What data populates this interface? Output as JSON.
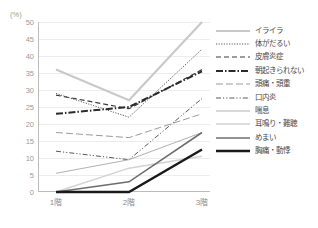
{
  "axis": {
    "unit_label": "(%)",
    "y_ticks": [
      0,
      5,
      10,
      15,
      20,
      25,
      30,
      35,
      40,
      45,
      50
    ],
    "x_ticks": [
      "1階",
      "2階",
      "3階"
    ]
  },
  "chart_data": {
    "type": "line",
    "title": "",
    "xlabel": "",
    "ylabel": "(%)",
    "ylim": [
      0,
      50
    ],
    "grid": true,
    "legend_position": "right",
    "categories": [
      "1階",
      "2階",
      "3階"
    ],
    "series": [
      {
        "name": "イライラ",
        "values": [
          36,
          27,
          50
        ],
        "color": "#c9c9c9",
        "width": 2.2,
        "dash": "none"
      },
      {
        "name": "体がだるい",
        "values": [
          29,
          22,
          42
        ],
        "color": "#5a5a5a",
        "width": 1.0,
        "dash": "1.2,1.4"
      },
      {
        "name": "皮膚炎症",
        "values": [
          28.5,
          24.5,
          36
        ],
        "color": "#3c3c3c",
        "width": 1.2,
        "dash": "5,3"
      },
      {
        "name": "朝起きられない",
        "values": [
          23,
          25,
          35.5
        ],
        "color": "#2b2b2b",
        "width": 2.0,
        "dash": "7,2,1.5,2"
      },
      {
        "name": "頭痛・頭重",
        "values": [
          17.5,
          16,
          23
        ],
        "color": "#909090",
        "width": 0.9,
        "dash": "7,3"
      },
      {
        "name": "口内炎",
        "values": [
          12,
          9.5,
          27.5
        ],
        "color": "#585858",
        "width": 1.0,
        "dash": "5,2,1.2,2,1.2,2"
      },
      {
        "name": "喘息",
        "values": [
          5.5,
          9.5,
          17.5
        ],
        "color": "#a8a8a8",
        "width": 0.9,
        "dash": "none"
      },
      {
        "name": "耳鳴り・難聴",
        "values": [
          0,
          7,
          10.5
        ],
        "color": "#d2d2d2",
        "width": 1.4,
        "dash": "none"
      },
      {
        "name": "めまい",
        "values": [
          0,
          3,
          17.5
        ],
        "color": "#6e6e6e",
        "width": 1.6,
        "dash": "none"
      },
      {
        "name": "胸痛・動悸",
        "values": [
          0,
          0,
          12.5
        ],
        "color": "#1a1a1a",
        "width": 2.4,
        "dash": "none"
      }
    ]
  }
}
